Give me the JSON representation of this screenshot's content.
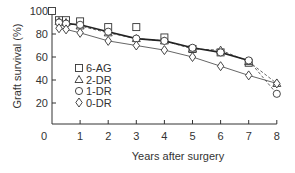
{
  "chart_data": {
    "type": "line",
    "title": "",
    "xlabel": "Years after surgery",
    "ylabel": "Graft survival (%)",
    "xlim": [
      0,
      8
    ],
    "ylim": [
      0,
      100
    ],
    "x_ticks": [
      0,
      1,
      2,
      3,
      4,
      5,
      6,
      7,
      8
    ],
    "y_ticks": [
      20,
      40,
      60,
      80,
      100
    ],
    "grid": false,
    "legend_position": "inside-left-middle",
    "series": [
      {
        "name": "6-AG",
        "marker": "square",
        "line": "solid-thick",
        "points": [
          [
            0,
            100
          ],
          [
            0.25,
            92
          ],
          [
            0.5,
            92
          ],
          [
            1,
            91
          ],
          [
            2,
            86
          ],
          [
            3,
            86
          ],
          [
            4,
            77
          ],
          [
            5,
            67
          ],
          [
            6,
            64
          ],
          [
            7,
            55
          ]
        ]
      },
      {
        "name": "2-DR",
        "marker": "triangle",
        "line": "dashed",
        "points": [
          [
            0.25,
            91
          ],
          [
            0.5,
            90
          ],
          [
            1,
            87
          ],
          [
            2,
            81
          ],
          [
            3,
            76
          ],
          [
            4,
            74
          ],
          [
            5,
            67
          ],
          [
            6,
            66
          ],
          [
            7,
            56
          ],
          [
            8,
            37
          ]
        ]
      },
      {
        "name": "1-DR",
        "marker": "circle",
        "line": "solid-thick",
        "points": [
          [
            0.25,
            90
          ],
          [
            0.5,
            89
          ],
          [
            1,
            88
          ],
          [
            2,
            82
          ],
          [
            3,
            76
          ],
          [
            4,
            74
          ],
          [
            5,
            68
          ],
          [
            6,
            64
          ],
          [
            7,
            57
          ],
          [
            8,
            28
          ]
        ]
      },
      {
        "name": "0-DR",
        "marker": "diamond",
        "line": "solid-thin",
        "points": [
          [
            0.25,
            85
          ],
          [
            0.5,
            84
          ],
          [
            1,
            81
          ],
          [
            2,
            74
          ],
          [
            3,
            70
          ],
          [
            4,
            66
          ],
          [
            5,
            60
          ],
          [
            6,
            52
          ],
          [
            7,
            44
          ],
          [
            8,
            37
          ]
        ]
      }
    ]
  },
  "legend": {
    "items": [
      {
        "symbol": "□",
        "label": "6-AG"
      },
      {
        "symbol": "△",
        "label": "2-DR"
      },
      {
        "symbol": "○",
        "label": "1-DR"
      },
      {
        "symbol": "◊",
        "label": "0-DR"
      }
    ]
  },
  "axes": {
    "x_label": "Years after surgery",
    "y_label": "Graft survival (%)"
  },
  "colors": {
    "ink": "#333333",
    "line": "#222222",
    "grey_line": "#555555"
  }
}
